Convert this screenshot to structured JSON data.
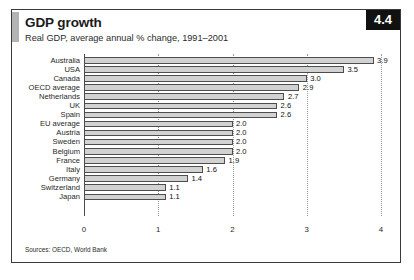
{
  "figure": {
    "number_badge": "4.4",
    "title": "GDP growth",
    "subtitle": "Real GDP, average annual % change, 1991–2001",
    "source": "Sources: OECD, World Bank",
    "accent_color": "#b4b4b4",
    "badge_bg_color": "#111111",
    "badge_text_color": "#ffffff",
    "bar_fill_color": "#d2d2d2",
    "bar_border_color": "#4d4d4d",
    "frame_border_color": "#3a3a3a"
  },
  "chart_data": {
    "type": "bar",
    "orientation": "horizontal",
    "title": "GDP growth",
    "subtitle": "Real GDP, average annual % change, 1991–2001",
    "xlabel": "",
    "ylabel": "",
    "xlim": [
      0,
      4
    ],
    "xticks": [
      0,
      1,
      2,
      3,
      4
    ],
    "xtick_labels": [
      "0",
      "1",
      "2",
      "3",
      "4"
    ],
    "grid": "vertical-dotted",
    "legend": "none",
    "categories": [
      "Australia",
      "USA",
      "Canada",
      "OECD average",
      "Netherlands",
      "UK",
      "Spain",
      "EU average",
      "Austria",
      "Sweden",
      "Belgium",
      "France",
      "Italy",
      "Germany",
      "Switzerland",
      "Japan"
    ],
    "values": [
      3.9,
      3.5,
      3.0,
      2.9,
      2.7,
      2.6,
      2.6,
      2.0,
      2.0,
      2.0,
      2.0,
      1.9,
      1.6,
      1.4,
      1.1,
      1.1
    ],
    "value_labels": [
      "3.9",
      "3.5",
      "3.0",
      "2.9",
      "2.7",
      "2.6",
      "2.6",
      "2.0",
      "2.0",
      "2.0",
      "2.0",
      "1.9",
      "1.6",
      "1.4",
      "1.1",
      "1.1"
    ],
    "source": "Sources: OECD, World Bank"
  }
}
